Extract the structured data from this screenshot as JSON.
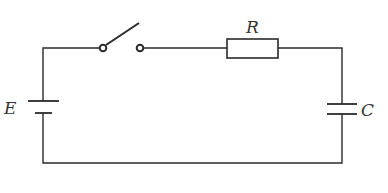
{
  "diagram": {
    "type": "circuit",
    "components": {
      "battery": {
        "label": "E"
      },
      "switch": {
        "state": "open"
      },
      "resistor": {
        "label": "R"
      },
      "capacitor": {
        "label": "C"
      }
    },
    "colors": {
      "line": "#2a2a2a",
      "background": "#ffffff",
      "label": "#333333"
    }
  }
}
